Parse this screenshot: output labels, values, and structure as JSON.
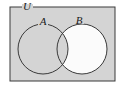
{
  "figure": {
    "width": 125,
    "height": 89
  },
  "labels": {
    "universe": "U",
    "set_a": "A",
    "set_b": "B"
  },
  "colors": {
    "page_background": "#ffffff",
    "universe_fill": "#d4d4d4",
    "shaded_region_fill": "#fbfbfb",
    "circle_fill": "none",
    "stroke": "#3a3a3a",
    "label_color": "#1a1a1a"
  },
  "geometry": {
    "universe_rect": {
      "x": 10,
      "y": 7,
      "width": 105,
      "height": 74
    },
    "circle_a": {
      "cx": 43,
      "cy": 49,
      "r": 25
    },
    "circle_b": {
      "cx": 82,
      "cy": 49,
      "r": 25
    },
    "label_universe_pos": {
      "x": 27,
      "y": 10
    },
    "label_a_pos": {
      "x": 43,
      "y": 25
    },
    "label_b_pos": {
      "x": 79,
      "y": 24
    }
  },
  "shading": {
    "region": "B \\ A",
    "description": "Only the portion of circle B outside circle A is filled white; circle A interior, the intersection, and the rest of the universe remain gray."
  }
}
